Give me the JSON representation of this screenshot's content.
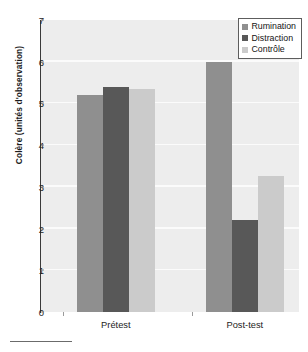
{
  "chart_data": {
    "type": "bar",
    "title": "",
    "xlabel": "",
    "ylabel": "Colère (unités d'observation)",
    "categories": [
      "Prétest",
      "Post-test"
    ],
    "series": [
      {
        "name": "Rumination",
        "color": "#8f8f8f",
        "values": [
          5.2,
          6.0
        ]
      },
      {
        "name": "Distraction",
        "color": "#585858",
        "values": [
          5.4,
          2.2
        ]
      },
      {
        "name": "Contrôle",
        "color": "#cbcbcb",
        "values": [
          5.35,
          3.25
        ]
      }
    ],
    "ylim": [
      0,
      7
    ],
    "yticks": [
      0,
      1,
      2,
      3,
      4,
      5,
      6,
      7
    ],
    "ytick_labels": [
      "0",
      "1",
      "2",
      "3",
      "4",
      "5",
      "6",
      "7"
    ],
    "grid": true,
    "legend_position": "top-right",
    "plot_background": "#ededed"
  },
  "legend": {
    "entries": [
      {
        "label": "Rumination"
      },
      {
        "label": "Distraction"
      },
      {
        "label": "Contrôle"
      }
    ]
  },
  "axis": {
    "y_title": "Colère (unités d'observation)"
  }
}
